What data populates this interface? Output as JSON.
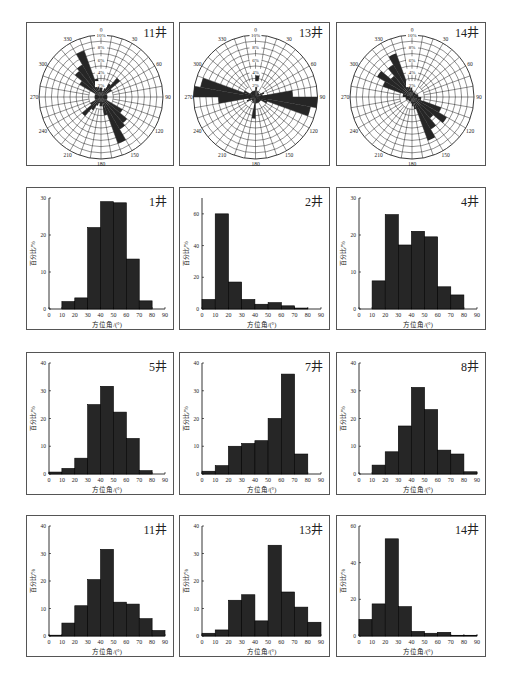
{
  "layout": {
    "rows_y": [
      [
        22,
        166
      ],
      [
        187,
        330
      ],
      [
        352,
        495
      ],
      [
        515,
        657
      ]
    ],
    "cols_x": [
      [
        26,
        174
      ],
      [
        179,
        330
      ],
      [
        336,
        486
      ]
    ]
  },
  "colors": {
    "bar": "#262626",
    "frame": "#555555",
    "grid": "#222222",
    "background": "#ffffff"
  },
  "chart_data": [
    {
      "type": "rose",
      "title": "11井",
      "position": [
        0,
        0
      ],
      "radial_ticks": [
        "2%",
        "4%",
        "6%",
        "8%",
        "10%"
      ],
      "angle_labels": [
        "0",
        "30",
        "60",
        "90",
        "120",
        "150",
        "180",
        "210",
        "240",
        "270",
        "300",
        "330"
      ],
      "bin_width_deg": 10,
      "petals": [
        {
          "from": 0,
          "to": 10,
          "value": 1.5
        },
        {
          "from": 10,
          "to": 20,
          "value": 1
        },
        {
          "from": 20,
          "to": 30,
          "value": 1.5
        },
        {
          "from": 30,
          "to": 40,
          "value": 2.5
        },
        {
          "from": 40,
          "to": 50,
          "value": 4
        },
        {
          "from": 50,
          "to": 60,
          "value": 2
        },
        {
          "from": 60,
          "to": 90,
          "value": 1
        },
        {
          "from": 300,
          "to": 310,
          "value": 4
        },
        {
          "from": 310,
          "to": 320,
          "value": 5.5
        },
        {
          "from": 320,
          "to": 330,
          "value": 6
        },
        {
          "from": 330,
          "to": 340,
          "value": 8
        },
        {
          "from": 340,
          "to": 350,
          "value": 3
        },
        {
          "from": 350,
          "to": 360,
          "value": 1.5
        },
        {
          "from": 270,
          "to": 300,
          "value": 1
        }
      ],
      "symmetric": true
    },
    {
      "type": "rose",
      "title": "13井",
      "position": [
        0,
        1
      ],
      "radial_ticks": [
        "2%",
        "4%",
        "6%",
        "8%",
        "10%"
      ],
      "angle_labels": [
        "0",
        "30",
        "60",
        "90",
        "120",
        "150",
        "180",
        "210",
        "240",
        "270",
        "300",
        "330"
      ],
      "bin_width_deg": 10,
      "petals": [
        {
          "from": 0,
          "to": 10,
          "value": 3.5
        },
        {
          "from": 10,
          "to": 20,
          "value": 1
        },
        {
          "from": 20,
          "to": 30,
          "value": 1
        },
        {
          "from": 30,
          "to": 60,
          "value": 0.8
        },
        {
          "from": 60,
          "to": 70,
          "value": 1.5
        },
        {
          "from": 70,
          "to": 80,
          "value": 1.2
        },
        {
          "from": 80,
          "to": 90,
          "value": 2
        },
        {
          "from": 90,
          "to": 100,
          "value": 2
        },
        {
          "from": 100,
          "to": 110,
          "value": 1.5
        },
        {
          "from": 110,
          "to": 120,
          "value": 1
        },
        {
          "from": 260,
          "to": 270,
          "value": 6
        },
        {
          "from": 270,
          "to": 280,
          "value": 10
        },
        {
          "from": 280,
          "to": 290,
          "value": 9
        },
        {
          "from": 290,
          "to": 300,
          "value": 2
        },
        {
          "from": 300,
          "to": 360,
          "value": 1
        }
      ],
      "symmetric": true
    },
    {
      "type": "rose",
      "title": "14井",
      "position": [
        0,
        2
      ],
      "radial_ticks": [
        "2%",
        "4%",
        "6%",
        "8%",
        "10%"
      ],
      "angle_labels": [
        "0",
        "30",
        "60",
        "90",
        "120",
        "150",
        "180",
        "210",
        "240",
        "270",
        "300",
        "330"
      ],
      "bin_width_deg": 10,
      "petals": [
        {
          "from": 0,
          "to": 10,
          "value": 1
        },
        {
          "from": 10,
          "to": 60,
          "value": 0.8
        },
        {
          "from": 60,
          "to": 90,
          "value": 1
        },
        {
          "from": 270,
          "to": 290,
          "value": 1.5
        },
        {
          "from": 290,
          "to": 300,
          "value": 5
        },
        {
          "from": 300,
          "to": 310,
          "value": 6.5
        },
        {
          "from": 310,
          "to": 320,
          "value": 4.5
        },
        {
          "from": 320,
          "to": 330,
          "value": 6
        },
        {
          "from": 330,
          "to": 340,
          "value": 7.5
        },
        {
          "from": 340,
          "to": 350,
          "value": 2
        },
        {
          "from": 350,
          "to": 360,
          "value": 1.5
        }
      ],
      "symmetric": true
    },
    {
      "type": "bar",
      "title": "1井",
      "position": [
        1,
        0
      ],
      "xlabel": "方位角/(°)",
      "ylabel": "百分比/%",
      "categories": [
        "0-10",
        "10-20",
        "20-30",
        "30-40",
        "40-50",
        "50-60",
        "60-70",
        "70-80",
        "80-90"
      ],
      "values": [
        0,
        2,
        3,
        22,
        29,
        28.7,
        13.5,
        2.2,
        0
      ],
      "xticks": [
        "0",
        "10",
        "20",
        "30",
        "40",
        "50",
        "60",
        "70",
        "80",
        "90"
      ],
      "yticks": [
        "0",
        "10",
        "20",
        "30"
      ],
      "ylim": [
        0,
        30
      ]
    },
    {
      "type": "bar",
      "title": "2井",
      "position": [
        1,
        1
      ],
      "xlabel": "方位角/(°)",
      "ylabel": "百分比/%",
      "categories": [
        "0-10",
        "10-20",
        "20-30",
        "30-40",
        "40-50",
        "50-60",
        "60-70",
        "70-80",
        "80-90"
      ],
      "values": [
        6,
        60,
        17,
        6,
        3,
        4,
        2,
        0.6,
        0
      ],
      "xticks": [
        "0",
        "10",
        "20",
        "30",
        "40",
        "50",
        "60",
        "70",
        "80",
        "90"
      ],
      "yticks": [
        "0",
        "20",
        "40",
        "60"
      ],
      "ylim": [
        0,
        70
      ]
    },
    {
      "type": "bar",
      "title": "4井",
      "position": [
        1,
        2
      ],
      "xlabel": "方位角/(°)",
      "ylabel": "百分比/%",
      "categories": [
        "0-10",
        "10-20",
        "20-30",
        "30-40",
        "40-50",
        "50-60",
        "60-70",
        "70-80",
        "80-90"
      ],
      "values": [
        0,
        7.6,
        25.5,
        17.3,
        21,
        19.5,
        6,
        3.8,
        0
      ],
      "xticks": [
        "0",
        "10",
        "20",
        "30",
        "40",
        "50",
        "60",
        "70",
        "80",
        "90"
      ],
      "yticks": [
        "0",
        "10",
        "20",
        "30"
      ],
      "ylim": [
        0,
        30
      ]
    },
    {
      "type": "bar",
      "title": "5井",
      "position": [
        2,
        0
      ],
      "xlabel": "方位角/(°)",
      "ylabel": "百分比/%",
      "categories": [
        "0-10",
        "10-20",
        "20-30",
        "30-40",
        "40-50",
        "50-60",
        "60-70",
        "70-80",
        "80-90"
      ],
      "values": [
        0.7,
        2,
        5.7,
        25,
        31.6,
        22.3,
        12.8,
        1.2,
        0
      ],
      "xticks": [
        "0",
        "10",
        "20",
        "30",
        "40",
        "50",
        "60",
        "70",
        "80",
        "90"
      ],
      "yticks": [
        "0",
        "10",
        "20",
        "30",
        "40"
      ],
      "ylim": [
        0,
        40
      ]
    },
    {
      "type": "bar",
      "title": "7井",
      "position": [
        2,
        1
      ],
      "xlabel": "方位角/(°)",
      "ylabel": "百分比/%",
      "categories": [
        "0-10",
        "10-20",
        "20-30",
        "30-40",
        "40-50",
        "50-60",
        "60-70",
        "70-80",
        "80-90"
      ],
      "values": [
        1,
        3,
        10,
        11,
        12,
        20,
        36,
        7.2,
        0
      ],
      "xticks": [
        "0",
        "10",
        "20",
        "30",
        "40",
        "50",
        "60",
        "70",
        "80",
        "90"
      ],
      "yticks": [
        "0",
        "10",
        "20",
        "30",
        "40"
      ],
      "ylim": [
        0,
        40
      ]
    },
    {
      "type": "bar",
      "title": "8井",
      "position": [
        2,
        2
      ],
      "xlabel": "方位角/(°)",
      "ylabel": "百分比/%",
      "categories": [
        "0-10",
        "10-20",
        "20-30",
        "30-40",
        "40-50",
        "50-60",
        "60-70",
        "70-80",
        "80-90"
      ],
      "values": [
        0,
        3.2,
        8,
        17.3,
        31.2,
        23.2,
        8.6,
        7.2,
        0.8
      ],
      "xticks": [
        "0",
        "10",
        "20",
        "30",
        "40",
        "50",
        "60",
        "70",
        "80",
        "90"
      ],
      "yticks": [
        "0",
        "10",
        "20",
        "30",
        "40"
      ],
      "ylim": [
        0,
        40
      ]
    },
    {
      "type": "bar",
      "title": "11井",
      "position": [
        3,
        0
      ],
      "xlabel": "方位角/(°)",
      "ylabel": "百分比/%",
      "categories": [
        "0-10",
        "10-20",
        "20-30",
        "30-40",
        "40-50",
        "50-60",
        "60-70",
        "70-80",
        "80-90"
      ],
      "values": [
        0.3,
        4.7,
        11,
        20.5,
        31.5,
        12.3,
        11.6,
        6.3,
        2
      ],
      "xticks": [
        "0",
        "10",
        "20",
        "30",
        "40",
        "50",
        "60",
        "70",
        "80",
        "90"
      ],
      "yticks": [
        "0",
        "10",
        "20",
        "30",
        "40"
      ],
      "ylim": [
        0,
        40
      ]
    },
    {
      "type": "bar",
      "title": "13井",
      "position": [
        3,
        1
      ],
      "xlabel": "方位角/(°)",
      "ylabel": "百分比/%",
      "categories": [
        "0-10",
        "10-20",
        "20-30",
        "30-40",
        "40-50",
        "50-60",
        "60-70",
        "70-80",
        "80-90"
      ],
      "values": [
        1,
        2.2,
        13,
        15,
        5.5,
        33,
        16,
        10.5,
        5
      ],
      "xticks": [
        "0",
        "10",
        "20",
        "30",
        "40",
        "50",
        "60",
        "70",
        "80",
        "90"
      ],
      "yticks": [
        "0",
        "10",
        "20",
        "30",
        "40"
      ],
      "ylim": [
        0,
        40
      ]
    },
    {
      "type": "bar",
      "title": "14井",
      "position": [
        3,
        2
      ],
      "xlabel": "方位角/(°)",
      "ylabel": "百分比/%",
      "categories": [
        "0-10",
        "10-20",
        "20-30",
        "30-40",
        "40-50",
        "50-60",
        "60-70",
        "70-80",
        "80-90"
      ],
      "values": [
        9,
        17.5,
        53,
        16,
        2.5,
        1.5,
        2,
        0.4,
        0.4
      ],
      "xticks": [
        "0",
        "10",
        "20",
        "30",
        "40",
        "50",
        "60",
        "70",
        "80",
        "90"
      ],
      "yticks": [
        "0",
        "20",
        "40",
        "60"
      ],
      "ylim": [
        0,
        60
      ]
    }
  ]
}
